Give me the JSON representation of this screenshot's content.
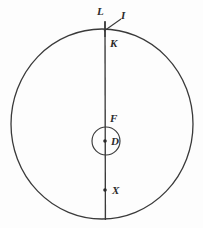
{
  "figure": {
    "kind": "geometric-diagram",
    "background_color": "#fdfdfd",
    "stroke_color": "#3a3a3a",
    "label_color": "#2b2b2b",
    "labels": {
      "L": "L",
      "I": "I",
      "K": "K",
      "F": "F",
      "D": "D",
      "X": "X"
    },
    "geometry": {
      "outer_circle": {
        "cx": 102,
        "cy": 124,
        "r": 95,
        "rx": 91,
        "ry": 95
      },
      "inner_circle": {
        "cx": 106,
        "cy": 141,
        "r": 14
      },
      "vertical_line": {
        "x": 105,
        "y_top": 22,
        "y_bottom": 220
      },
      "tick_at_L": {
        "x": 105,
        "y_top": 22,
        "y_bottom": 36
      },
      "leader_line_I": {
        "x1": 120,
        "y1": 18,
        "x2": 104,
        "y2": 31
      },
      "point_D": {
        "cx": 105,
        "cy": 141,
        "r": 1.7
      },
      "point_X": {
        "cx": 105,
        "cy": 190,
        "r": 1.7
      }
    }
  }
}
